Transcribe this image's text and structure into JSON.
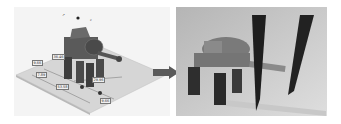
{
  "figure": {
    "left_panel": {
      "description": "isometric CAD render of robot on dimensioned plate",
      "dimension_labels": [
        "36.46",
        "9.66",
        "7.89",
        "53.58",
        "29.96",
        "9.66"
      ]
    },
    "arrow": {
      "direction": "right",
      "color": "#5a5a5a"
    },
    "right_panel": {
      "description": "photo of 3D printed robot with two pens"
    }
  }
}
